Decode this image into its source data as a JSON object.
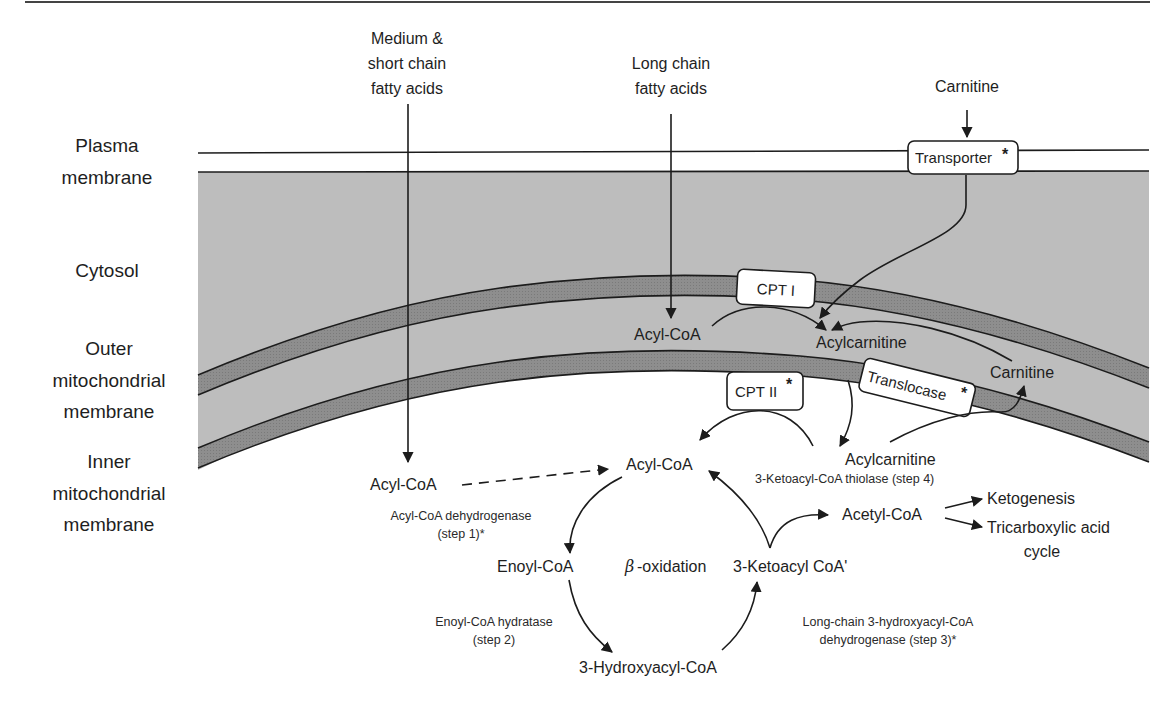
{
  "regions": {
    "plasma_membrane": [
      "Plasma",
      "membrane"
    ],
    "cytosol": "Cytosol",
    "outer_membrane": [
      "Outer",
      "mitochondrial",
      "membrane"
    ],
    "inner_membrane": [
      "Inner",
      "mitochondrial",
      "membrane"
    ]
  },
  "inputs": {
    "medium_short": [
      "Medium &",
      "short chain",
      "fatty acids"
    ],
    "long_chain": [
      "Long chain",
      "fatty acids"
    ],
    "carnitine": "Carnitine"
  },
  "proteins": {
    "transporter": "Transporter",
    "transporter_mark": "*",
    "cpt1": "CPT I",
    "cpt2": "CPT II",
    "cpt2_mark": "*",
    "translocase": "Translocase",
    "translocase_mark": "*"
  },
  "metabolites": {
    "acyl_coa_ims": "Acyl-CoA",
    "acylcarnitine_ims": "Acylcarnitine",
    "carnitine_ims": "Carnitine",
    "acyl_coa_matrix_left": "Acyl-CoA",
    "acyl_coa_matrix": "Acyl-CoA",
    "acylcarnitine_matrix": "Acylcarnitine",
    "enoyl_coa": "Enoyl-CoA",
    "hydroxyacyl_coa": "3-Hydroxyacyl-CoA",
    "ketoacyl_coa": "3-Ketoacyl CoA'",
    "acetyl_coa": "Acetyl-CoA",
    "ketogenesis": "Ketogenesis",
    "tca": [
      "Tricarboxylic acid",
      "cycle"
    ],
    "beta_oxidation": "-oxidation",
    "beta_symbol": "β"
  },
  "enzymes": {
    "step1": [
      "Acyl-CoA dehydrogenase",
      "(step 1)*"
    ],
    "step2": [
      "Enoyl-CoA hydratase",
      "(step 2)"
    ],
    "step3": [
      "Long-chain 3-hydroxyacyl-CoA",
      "dehydrogenase (step 3)*"
    ],
    "step4": "3-Ketoacyl-CoA thiolase (step 4)"
  },
  "colors": {
    "cytosol_fill": "#bdbdbd",
    "membrane_fill": "#8e8e8e",
    "line": "#1c1c1c",
    "background": "#ffffff"
  }
}
